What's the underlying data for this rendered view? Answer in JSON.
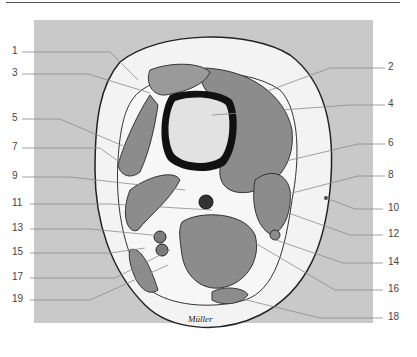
{
  "figure": {
    "signature": "Müller",
    "colors": {
      "background_panel": "#c9c9c9",
      "subcutaneous_fat": "#f3f3f3",
      "muscle": "#8c8c8c",
      "bone_cortex": "#111111",
      "bone_marrow": "#e2e2e2",
      "outline": "#222222",
      "leader_line": "#8a8a8a",
      "label_text": "#444444"
    },
    "labels_left": [
      {
        "n": "1",
        "y": 51,
        "target": [
          138,
          80
        ]
      },
      {
        "n": "3",
        "y": 73,
        "target": [
          150,
          93
        ]
      },
      {
        "n": "5",
        "y": 118,
        "target": [
          128,
          148
        ]
      },
      {
        "n": "7",
        "y": 147,
        "target": [
          118,
          161
        ]
      },
      {
        "n": "9",
        "y": 176,
        "target": [
          185,
          190
        ]
      },
      {
        "n": "11",
        "y": 203,
        "target": [
          212,
          210
        ]
      },
      {
        "n": "13",
        "y": 228,
        "target": [
          162,
          236
        ]
      },
      {
        "n": "15",
        "y": 252,
        "target": [
          145,
          248
        ]
      },
      {
        "n": "17",
        "y": 277,
        "target": [
          170,
          250
        ]
      },
      {
        "n": "19",
        "y": 299,
        "target": [
          168,
          265
        ]
      }
    ],
    "labels_right": [
      {
        "n": "2",
        "y": 67,
        "target": [
          265,
          92
        ]
      },
      {
        "n": "4",
        "y": 104,
        "target": [
          212,
          115
        ]
      },
      {
        "n": "6",
        "y": 143,
        "target": [
          248,
          170
        ]
      },
      {
        "n": "8",
        "y": 175,
        "target": [
          265,
          200
        ]
      },
      {
        "n": "10",
        "y": 208,
        "target": [
          325,
          200
        ]
      },
      {
        "n": "12",
        "y": 234,
        "target": [
          280,
          210
        ]
      },
      {
        "n": "14",
        "y": 262,
        "target": [
          276,
          240
        ]
      },
      {
        "n": "16",
        "y": 289,
        "target": [
          255,
          243
        ]
      },
      {
        "n": "18",
        "y": 317,
        "target": [
          230,
          296
        ]
      }
    ]
  }
}
